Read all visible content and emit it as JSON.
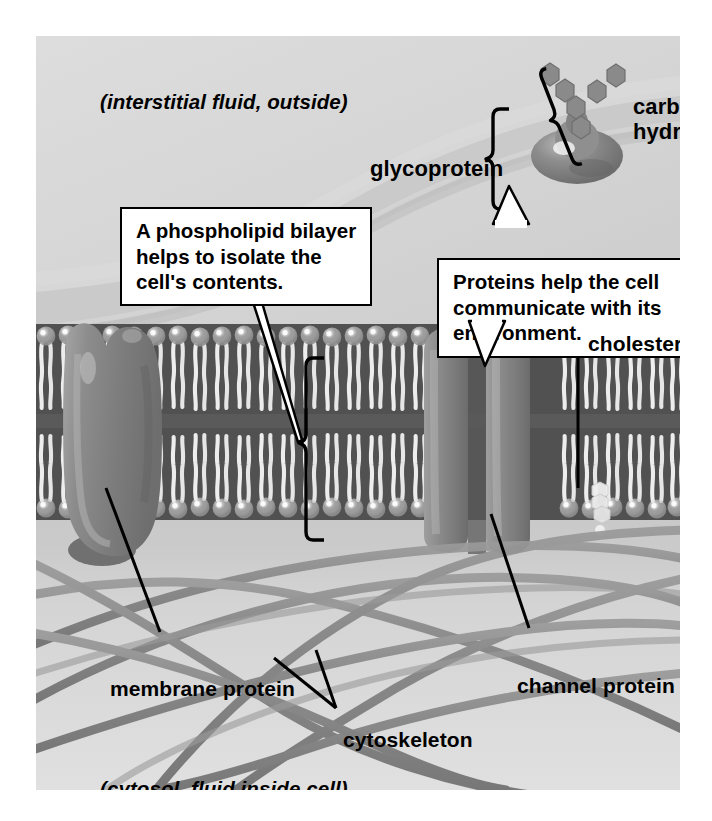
{
  "figure": {
    "type": "diagram",
    "background_color": "#d8d8d8",
    "text_color": "#000000"
  },
  "environment_labels": {
    "outside": "(interstitial fluid, outside)",
    "inside": "(cytosol, fluid inside cell)"
  },
  "part_labels": [
    {
      "id": "carbohydrate",
      "text": "carbo-\nhydrate",
      "line1": "carbo-",
      "line2": "hydrate"
    },
    {
      "id": "glycoprotein",
      "text": "glycoprotein"
    },
    {
      "id": "cholesterol",
      "text": "cholesterol"
    },
    {
      "id": "membrane-protein",
      "text": "membrane protein"
    },
    {
      "id": "channel-protein",
      "text": "channel protein"
    },
    {
      "id": "cytoskeleton",
      "text": "cytoskeleton"
    }
  ],
  "callouts": [
    {
      "id": "bilayer-callout",
      "lines": [
        "A phospholipid bilayer",
        "helps to isolate the",
        "cell's contents."
      ],
      "text": "A phospholipid bilayer helps to isolate the cell's contents."
    },
    {
      "id": "protein-callout",
      "lines": [
        "Proteins help the cell",
        "communicate with",
        "its environment."
      ],
      "text": "Proteins help the cell communicate with its environment."
    }
  ],
  "structures": {
    "phospholipid_head_color": "#c9c9c9",
    "phospholipid_tail_color": "#e3e3e3",
    "membrane_core_color": "#5d5d5d",
    "protein_color": "#8f8f8f",
    "carbohydrate_color": "#8c8c8c",
    "cytoskeleton_color": "#8a8a8a",
    "cholesterol_color": "#e8e8e8",
    "bilayer_bracket": "vertical bracket spanning the two leaflets",
    "glycoprotein_bracket": "vertical bracket spanning sugar chain plus protein",
    "carbohydrate_bracket": "bracket spanning the branched sugar chain"
  }
}
